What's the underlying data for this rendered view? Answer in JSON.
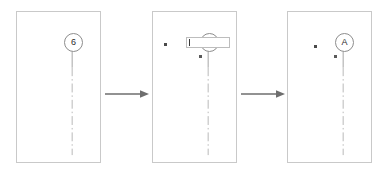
{
  "diagram": {
    "type": "process-flow",
    "step_count": 3,
    "colors": {
      "panel_border": "#c9c9c9",
      "balloon_stroke": "#8d8d8d",
      "leader_line": "#9a9a9a",
      "centerline": "#b0b0b0",
      "arrow": "#6e6e6e",
      "text": "#2b2b2b",
      "background": "#ffffff"
    }
  },
  "panels": [
    {
      "id": "panel-1",
      "step": "1",
      "balloon": {
        "label": "6",
        "shape": "circle"
      },
      "leader": {
        "style": "solid-then-dash-dot",
        "orientation": "vertical"
      },
      "edit_box": null,
      "marks": []
    },
    {
      "id": "panel-2",
      "step": "2",
      "balloon": {
        "label": "6",
        "shape": "circle"
      },
      "leader": {
        "style": "solid-then-dash-dot",
        "orientation": "vertical"
      },
      "edit_box": {
        "value": "",
        "placeholder": "",
        "caret_visible": true
      },
      "marks": [
        {
          "name": "grip-handle",
          "x": 11,
          "y": 31
        },
        {
          "name": "attach-point",
          "x": 46,
          "y": 43
        }
      ]
    },
    {
      "id": "panel-3",
      "step": "3",
      "balloon": {
        "label": "A",
        "shape": "circle"
      },
      "leader": {
        "style": "solid-then-dash-dot",
        "orientation": "vertical"
      },
      "edit_box": null,
      "marks": [
        {
          "name": "grip-handle",
          "x": 26,
          "y": 33
        },
        {
          "name": "attach-point",
          "x": 46,
          "y": 43
        }
      ]
    }
  ],
  "arrows": [
    {
      "id": "arrow-1",
      "direction": "right",
      "label": ""
    },
    {
      "id": "arrow-2",
      "direction": "right",
      "label": ""
    }
  ]
}
